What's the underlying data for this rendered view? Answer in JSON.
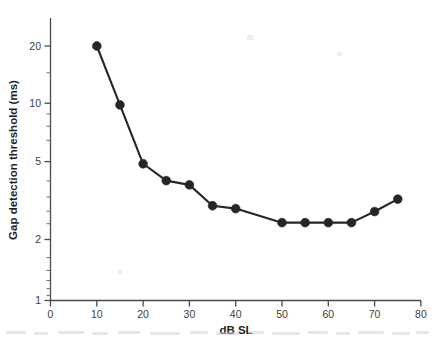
{
  "chart_data": {
    "type": "line",
    "title": "",
    "subtitle": "",
    "xlabel": "dB SL",
    "ylabel": "Gap detection threshold (ms)",
    "xlim": [
      0,
      80
    ],
    "ylim": [
      1,
      25
    ],
    "yscale": "log",
    "xscale": "linear",
    "grid": false,
    "legend": null,
    "xticks": [
      0,
      10,
      20,
      30,
      40,
      50,
      60,
      70,
      80
    ],
    "xtick_labels": [
      "0",
      "10",
      "20",
      "30",
      "40",
      "50",
      "60",
      "70",
      "80"
    ],
    "yticks": [
      1,
      2,
      5,
      10,
      20
    ],
    "ytick_labels": [
      "1",
      "2",
      "5",
      "10",
      "20"
    ],
    "yminorticks": [
      3,
      4,
      6,
      7,
      8,
      9,
      15
    ],
    "series": [
      {
        "name": "Gap detection threshold",
        "marker": "filled-circle",
        "color": "#262626",
        "x": [
          10,
          15,
          20,
          25,
          30,
          35,
          40,
          50,
          55,
          60,
          65,
          70,
          75
        ],
        "values": [
          20.0,
          10.0,
          5.0,
          4.1,
          3.9,
          3.05,
          2.95,
          2.5,
          2.5,
          2.5,
          2.5,
          2.85,
          3.3
        ]
      }
    ]
  },
  "figure": {
    "caption": ""
  }
}
